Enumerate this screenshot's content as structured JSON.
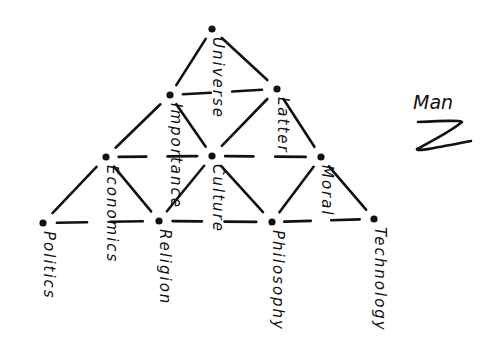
{
  "diagram": {
    "title": "Man",
    "title_mark": "z-squiggle",
    "type": "triangular-lattice",
    "nodes": [
      {
        "id": "universe",
        "label": "Universe",
        "x": 212,
        "y": 29,
        "row": 0
      },
      {
        "id": "importance",
        "label": "Importance",
        "x": 170,
        "y": 95,
        "row": 1
      },
      {
        "id": "latter",
        "label": "Latter",
        "x": 277,
        "y": 89,
        "row": 1
      },
      {
        "id": "economics",
        "label": "Economics",
        "x": 106,
        "y": 157,
        "row": 2
      },
      {
        "id": "culture",
        "label": "Culture",
        "x": 212,
        "y": 156,
        "row": 2
      },
      {
        "id": "moral",
        "label": "Moral",
        "x": 321,
        "y": 157,
        "row": 2
      },
      {
        "id": "politics",
        "label": "Politics",
        "x": 43,
        "y": 223,
        "row": 3
      },
      {
        "id": "religion",
        "label": "Religion",
        "x": 159,
        "y": 221,
        "row": 3
      },
      {
        "id": "philosophy",
        "label": "Philosophy",
        "x": 272,
        "y": 222,
        "row": 3
      },
      {
        "id": "technology",
        "label": "Technology",
        "x": 374,
        "y": 219,
        "row": 3
      }
    ],
    "edges": [
      [
        "universe",
        "importance"
      ],
      [
        "universe",
        "latter"
      ],
      [
        "importance",
        "latter"
      ],
      [
        "importance",
        "economics"
      ],
      [
        "importance",
        "culture"
      ],
      [
        "latter",
        "culture"
      ],
      [
        "latter",
        "moral"
      ],
      [
        "economics",
        "culture"
      ],
      [
        "culture",
        "moral"
      ],
      [
        "economics",
        "politics"
      ],
      [
        "economics",
        "religion"
      ],
      [
        "culture",
        "religion"
      ],
      [
        "culture",
        "philosophy"
      ],
      [
        "moral",
        "philosophy"
      ],
      [
        "moral",
        "technology"
      ],
      [
        "politics",
        "religion"
      ],
      [
        "religion",
        "philosophy"
      ],
      [
        "philosophy",
        "technology"
      ]
    ],
    "colors": {
      "ink": "#111111",
      "background": "#ffffff"
    }
  }
}
